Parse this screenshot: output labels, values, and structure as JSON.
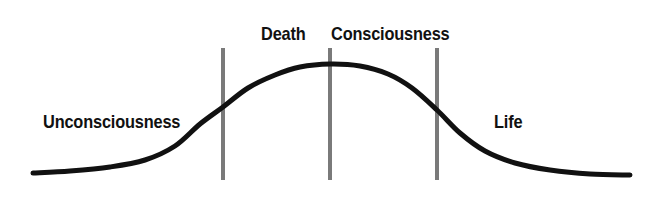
{
  "canvas": {
    "width": 657,
    "height": 197,
    "background_color": "#ffffff"
  },
  "colors": {
    "curve": "#111111",
    "divider_line": "#7a7a7a",
    "label_text": "#111111",
    "background": "#ffffff"
  },
  "labels": {
    "unconsciousness": "Unconsciousness",
    "death": "Death",
    "consciousness": "Consciousness",
    "life": "Life"
  },
  "chart_data": {
    "type": "line",
    "title": "",
    "xlabel": "",
    "ylabel": "",
    "grid": false,
    "legend_position": "none",
    "xlim": [
      0,
      657
    ],
    "ylim": [
      197,
      0
    ],
    "series": [
      {
        "name": "consciousness-curve",
        "stroke_color": "#111111",
        "stroke_width": 5,
        "points": [
          [
            33,
            173
          ],
          [
            70,
            171
          ],
          [
            110,
            167
          ],
          [
            145,
            160
          ],
          [
            175,
            146
          ],
          [
            200,
            124
          ],
          [
            223,
            107
          ],
          [
            248,
            88
          ],
          [
            275,
            75
          ],
          [
            300,
            67
          ],
          [
            330,
            64
          ],
          [
            360,
            66
          ],
          [
            388,
            74
          ],
          [
            412,
            88
          ],
          [
            437,
            110
          ],
          [
            460,
            133
          ],
          [
            485,
            151
          ],
          [
            515,
            163
          ],
          [
            550,
            170
          ],
          [
            590,
            174
          ],
          [
            630,
            175
          ]
        ]
      }
    ],
    "annotations": [
      {
        "name": "divider-death",
        "type": "vline",
        "x": 223,
        "y_top": 48,
        "y_bottom": 180,
        "color": "#7a7a7a",
        "width": 4,
        "label": "Death"
      },
      {
        "name": "divider-consciousness",
        "type": "vline",
        "x": 330,
        "y_top": 48,
        "y_bottom": 180,
        "color": "#7a7a7a",
        "width": 4,
        "label": "Consciousness"
      },
      {
        "name": "divider-life",
        "type": "vline",
        "x": 437,
        "y_top": 48,
        "y_bottom": 180,
        "color": "#7a7a7a",
        "width": 4,
        "label": "Life"
      }
    ],
    "text_labels": [
      {
        "name": "unconsciousness",
        "text": "Unconsciousness",
        "x": 43,
        "y": 128
      },
      {
        "name": "death",
        "text": "Death",
        "x": 261,
        "y": 40
      },
      {
        "name": "consciousness",
        "text": "Consciousness",
        "x": 331,
        "y": 40
      },
      {
        "name": "life",
        "text": "Life",
        "x": 494,
        "y": 40
      }
    ]
  }
}
